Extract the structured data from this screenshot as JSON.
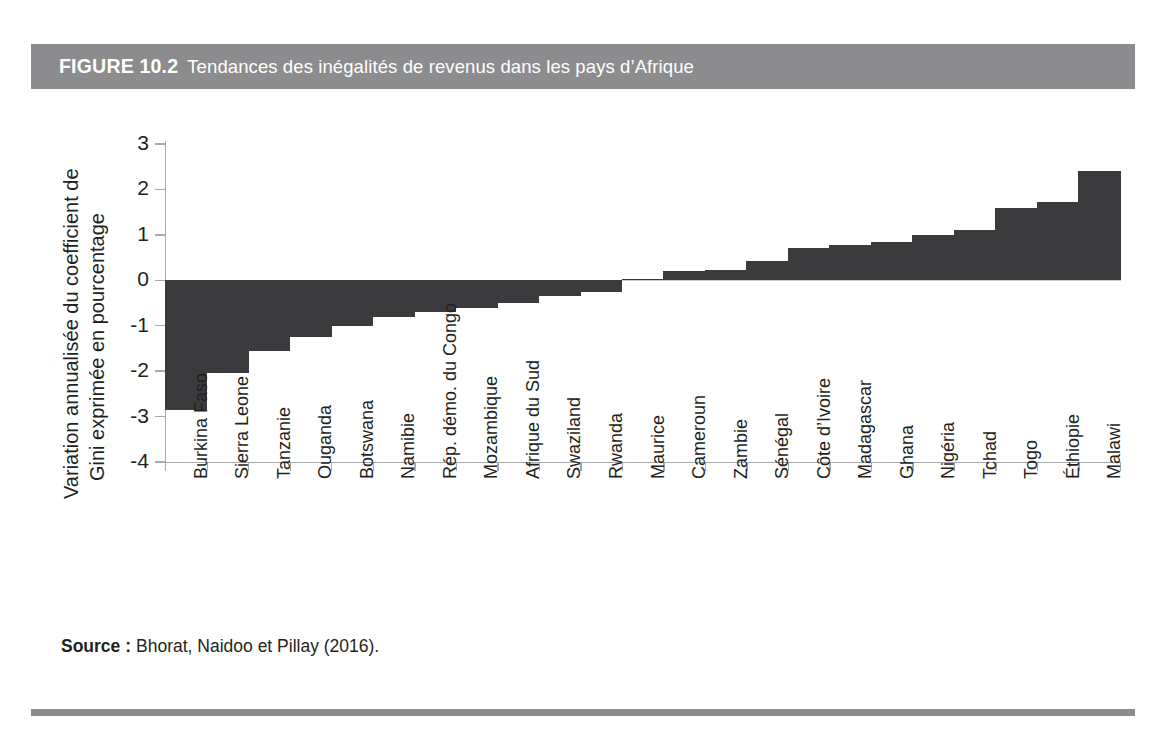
{
  "figure": {
    "number_label": "FIGURE 10.2",
    "title": "Tendances des inégalités de revenus dans les pays d’Afrique",
    "band_color": "#8c8c8e",
    "bar_color": "#3b3b3d",
    "axis_color": "#a7a9ac",
    "text_color": "#231f20"
  },
  "source": {
    "label": "Source :",
    "text": "Bhorat, Naidoo et Pillay (2016)."
  },
  "chart_data": {
    "type": "bar",
    "title": "Tendances des inégalités de revenus dans les pays d’Afrique",
    "xlabel": "",
    "ylabel_lines": [
      "Variation annualisée du coefficient de",
      "Gini exprimée en pourcentage"
    ],
    "ylabel": "Variation annualisée du coefficient de Gini exprimée en pourcentage",
    "ylim": [
      -4,
      3
    ],
    "yticks": [
      3,
      2,
      1,
      0,
      -1,
      -2,
      -3,
      -4
    ],
    "ytick_labels": [
      "3",
      "2",
      "1",
      "0",
      "-1",
      "-2",
      "-3",
      "-4"
    ],
    "grid": false,
    "legend": "none",
    "orientation": "vertical",
    "categories": [
      "Burkina Faso",
      "Sierra Leone",
      "Tanzanie",
      "Ouganda",
      "Botswana",
      "Namibie",
      "Rép. démo. du Congo",
      "Mozambique",
      "Afrique du Sud",
      "Swaziland",
      "Rwanda",
      "Maurice",
      "Cameroun",
      "Zambie",
      "Sénégal",
      "Côte d’Ivoire",
      "Madagascar",
      "Ghana",
      "Nigéria",
      "Tchad",
      "Togo",
      "Éthiopie",
      "Malawi"
    ],
    "values": [
      -2.85,
      -2.05,
      -1.55,
      -1.25,
      -1.0,
      -0.8,
      -0.7,
      -0.6,
      -0.5,
      -0.35,
      -0.25,
      0.03,
      0.2,
      0.22,
      0.42,
      0.72,
      0.78,
      0.85,
      1.0,
      1.1,
      1.6,
      1.72,
      2.4
    ]
  }
}
